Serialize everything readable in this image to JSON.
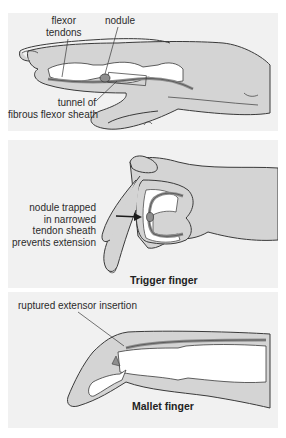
{
  "figure": {
    "panels": [
      {
        "id": "normal-finger",
        "labels": {
          "flexor_tendons": [
            "flexor",
            "tendons"
          ],
          "nodule": "nodule",
          "tunnel": [
            "tunnel of",
            "fibrous flexor sheath"
          ]
        }
      },
      {
        "id": "trigger-finger",
        "caption": "Trigger finger",
        "labels": {
          "nodule_trapped": [
            "nodule trapped",
            "in narrowed",
            "tendon sheath",
            "prevents extension"
          ]
        }
      },
      {
        "id": "mallet-finger",
        "caption": "Mallet finger",
        "labels": {
          "ruptured": "ruptured extensor insertion"
        }
      }
    ],
    "colors": {
      "panel_bg": "#f1f1f1",
      "skin": "#d4d4d4",
      "bone": "#ffffff",
      "tendon": "#8e8e8e",
      "outline": "#3a3a3a"
    }
  }
}
